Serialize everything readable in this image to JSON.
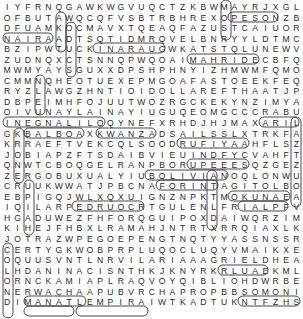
{
  "puzzle": {
    "type": "word-search",
    "columns": 29,
    "rows": [
      "IYFRNQGAWKWGVUQCTZKBWMAYRJXGL",
      "OFBUTAWQCQFVSBTRBHREXOPESONZB",
      "DFUAMKOCMAVXTQEAQFAZUSTCAIUOR",
      "NAIRAADTSQTIDMRQVELBNRYYLDTMC",
      "BZIPWTUCKINARAUGWKATSTQLUNEWV",
      "ZUDNQXCTSNNQPWQOAIMAHRIDECBFQ",
      "MWMYAYSGUXXDPSHPHNYIZHMWMFQMO",
      "CMMNQHEOTUEXEPMGOAFASTOEEKFEQ",
      "RYZLAWGZHNTIOIDOLLAREFTHAATJP",
      "DBPEIMHFOJUUTWOZRGCKEKYNZIMYA",
      "OIVUNAYLAINAYIUGUQEOMGCCCRABU",
      "INEGNALILOQYNEFXRHDJHJMAXARIL",
      "GKBALBOAXKWANZADSAILSSLXTRKFA",
      "KRRAEFTVEKCQLSOODRUFIYAAHFLSZ",
      "JOBIAPZFTSDAIBVIEUINDFYCVAHFT",
      "QNWTCBOQGELRANPBORUPEEESQZGEZ",
      "ZERGOBUXUALYIUBOLIVIANOQLONWU",
      "CRUUKWWATJPBCNAFORINTAGITOLBO",
      "EBPIGQJWLXQXUIGNZNPKTMOKUNAEA",
      "IQILARPEDRUOCRTGULENLFRIALPFV",
      "HGADUWEZFHFORQGUIPOXDAIWQRZIM",
      "KIHEJFHBXLRAMAHJNTRTXRRQIAXLK",
      "JOTRAZWPEGOEPENGTNQTYYASSNSSR",
      "CERTYGKWOBPRPLUQOCLUQYVMAIKXE",
      "OQUUSVNTLNRVILARIAAAGRIELDHEA",
      "LHDANINACISNTHKJKNYRKRLUAEKML",
      "ORNCKAMIAPLRAQVOYQIBLIOHDWRBE",
      "NERWACHAAPUBVRCHAPROPBBSOMONI",
      "DIMANATLEMPIRAIWTKADTUKNTFZHS"
    ],
    "found_words": [
      "NAIRA",
      "PESO",
      "INARAUG",
      "MAHRIDE",
      "DOLLAR",
      "INEGNALILO",
      "BALBOA",
      "KWANZA",
      "RUFIYAA",
      "RUPEE",
      "BOLIVIAN",
      "FORINT",
      "EDRUOC",
      "RIAL",
      "OKUNA",
      "ARIL",
      "RIEL",
      "SOMONI",
      "KWACHA",
      "MANAT",
      "LEMPIRA",
      "NARI"
    ],
    "colors": {
      "letter": "#2a2a2a",
      "outline": "#333333",
      "background": "#ffffff"
    }
  }
}
